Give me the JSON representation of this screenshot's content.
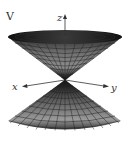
{
  "figure": {
    "panel_label": "V",
    "surface": "double cone",
    "axes": {
      "x_label": "x",
      "y_label": "y",
      "z_label": "z"
    },
    "colors": {
      "mesh_dark": "#1a1a1a",
      "mesh_mid": "#555555",
      "mesh_light": "#9a9a9a",
      "axis": "#333333",
      "background": "#ffffff"
    }
  }
}
